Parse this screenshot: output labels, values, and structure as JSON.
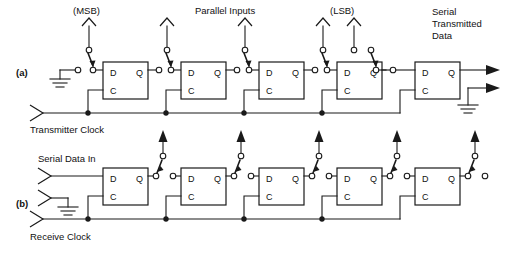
{
  "figure": {
    "background_color": "#ffffff",
    "line_color": "#1a1a1a"
  },
  "sections": [
    {
      "id": "a",
      "label": "(a)",
      "role": "parallel-in-serial-out-transmitter",
      "clock_label": "Transmitter Clock",
      "stage_count": 5
    },
    {
      "id": "b",
      "label": "(b)",
      "role": "serial-in-parallel-out-receiver",
      "clock_label": "Receive Clock",
      "stage_count": 5
    }
  ],
  "labels": {
    "msb": "(MSB)",
    "parallel_inputs": "Parallel Inputs",
    "lsb": "(LSB)",
    "serial_out_line1": "Serial",
    "serial_out_line2": "Transmitted",
    "serial_out_line3": "Data",
    "transmitter_clock": "Transmitter Clock",
    "receive_clock": "Receive Clock",
    "serial_data_in": "Serial Data In",
    "section_a": "(a)",
    "section_b": "(b)"
  },
  "flipflop": {
    "pin_d": "D",
    "pin_q": "Q",
    "pin_c": "C"
  },
  "stages_a": [
    {
      "index": 1,
      "pin_d": "D",
      "pin_q": "Q",
      "pin_c": "C"
    },
    {
      "index": 2,
      "pin_d": "D",
      "pin_q": "Q",
      "pin_c": "C"
    },
    {
      "index": 3,
      "pin_d": "D",
      "pin_q": "Q",
      "pin_c": "C"
    },
    {
      "index": 4,
      "pin_d": "D",
      "pin_q": "Q",
      "pin_c": "C"
    },
    {
      "index": 5,
      "pin_d": "D",
      "pin_q": "Q",
      "pin_c": "C"
    }
  ],
  "stages_b": [
    {
      "index": 1,
      "pin_d": "D",
      "pin_q": "Q",
      "pin_c": "C"
    },
    {
      "index": 2,
      "pin_d": "D",
      "pin_q": "Q",
      "pin_c": "C"
    },
    {
      "index": 3,
      "pin_d": "D",
      "pin_q": "Q",
      "pin_c": "C"
    },
    {
      "index": 4,
      "pin_d": "D",
      "pin_q": "Q",
      "pin_c": "C"
    },
    {
      "index": 5,
      "pin_d": "D",
      "pin_q": "Q",
      "pin_c": "C"
    }
  ]
}
